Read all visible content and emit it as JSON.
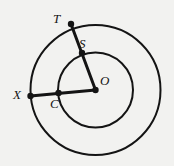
{
  "figure": {
    "background_color": "#f2f2f0",
    "stroke_color": "#141414",
    "center": {
      "name": "O",
      "x": 95.5,
      "y": 90
    },
    "circles": [
      {
        "name": "inner-circle",
        "cx": 95.5,
        "cy": 90,
        "r": 37.5,
        "stroke_width": 2
      },
      {
        "name": "outer-circle",
        "cx": 95.5,
        "cy": 90,
        "r": 65,
        "stroke_width": 2
      }
    ],
    "segments": [
      {
        "name": "segment-OT",
        "from": "O",
        "to": "T",
        "x1": 95.5,
        "y1": 90,
        "x2": 71,
        "y2": 24,
        "stroke_width": 3
      },
      {
        "name": "segment-OX",
        "from": "O",
        "to": "X",
        "x1": 95.5,
        "y1": 90,
        "x2": 30.5,
        "y2": 96,
        "stroke_width": 3
      }
    ],
    "points": [
      {
        "name": "T",
        "label": "T",
        "x": 71,
        "y": 24,
        "on": "outer-circle",
        "dot_r": 3
      },
      {
        "name": "S",
        "label": "S",
        "x": 82,
        "y": 53,
        "on": "inner-circle",
        "dot_r": 3
      },
      {
        "name": "O",
        "label": "O",
        "x": 95.5,
        "y": 90,
        "on": "center",
        "dot_r": 3
      },
      {
        "name": "X",
        "label": "X",
        "x": 30.5,
        "y": 96,
        "on": "outer-circle",
        "dot_r": 3
      },
      {
        "name": "C",
        "label": "C",
        "x": 58.5,
        "y": 93,
        "on": "inner-circle",
        "dot_r": 3
      }
    ],
    "labels": {
      "T": "T",
      "S": "S",
      "O": "O",
      "X": "X",
      "C": "C"
    }
  }
}
